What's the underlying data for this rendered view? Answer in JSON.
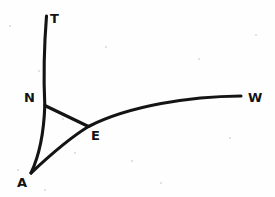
{
  "page": {
    "background_color": "#fefefe",
    "ink_color": "#141414",
    "width": 275,
    "height": 197
  },
  "diagram": {
    "title": "",
    "type": "hand-drawn-geometric-figure",
    "stroke_color": "#141414",
    "stroke_width": 3.1,
    "labels": [
      {
        "id": "T",
        "text": "T",
        "x": 50,
        "y": 12
      },
      {
        "id": "N",
        "text": "N",
        "x": 24,
        "y": 91
      },
      {
        "id": "E",
        "text": "E",
        "x": 91,
        "y": 129
      },
      {
        "id": "W",
        "text": "W",
        "x": 248,
        "y": 91
      },
      {
        "id": "A",
        "text": "A",
        "x": 17,
        "y": 176
      }
    ],
    "vertices": [
      {
        "id": "T",
        "x": 46,
        "y": 16
      },
      {
        "id": "N",
        "x": 45,
        "y": 105
      },
      {
        "id": "E",
        "x": 88,
        "y": 126
      },
      {
        "id": "W",
        "x": 241,
        "y": 96
      },
      {
        "id": "A",
        "x": 31,
        "y": 173
      }
    ],
    "paths": [
      {
        "id": "curve-T-N-A",
        "name": "vertical-curve-T-to-A",
        "kind": "curve",
        "from": "T",
        "through": "N",
        "to": "A",
        "d": "M 46.5 16 C 44.2 45 43.6 80 44.8 105.5 C 44.0 130 39.5 155 31 173"
      },
      {
        "id": "curve-A-E-W",
        "name": "arc-curve-A-to-W",
        "kind": "curve",
        "from": "A",
        "through": "E",
        "to": "W",
        "d": "M 31 173 C 48 157 68 139 88.5 126.5 C 130 105.5 190 96.5 241 96"
      },
      {
        "id": "line-N-E",
        "name": "chord-line-N-to-E",
        "kind": "line",
        "from": "N",
        "to": "E",
        "d": "M 44.8 105.5 L 88.5 126.5"
      }
    ],
    "specks": [
      {
        "x": 9,
        "y": 25,
        "size": 2
      },
      {
        "x": 38,
        "y": 70,
        "size": 2
      },
      {
        "x": 62,
        "y": 118,
        "size": 2
      },
      {
        "x": 74,
        "y": 152,
        "size": 2
      },
      {
        "x": 131,
        "y": 160,
        "size": 2
      },
      {
        "x": 198,
        "y": 58,
        "size": 2
      },
      {
        "x": 229,
        "y": 137,
        "size": 2
      },
      {
        "x": 17,
        "y": 169,
        "size": 2
      },
      {
        "x": 255,
        "y": 34,
        "size": 2
      },
      {
        "x": 105,
        "y": 46,
        "size": 2
      },
      {
        "x": 160,
        "y": 182,
        "size": 2
      },
      {
        "x": 44,
        "y": 189,
        "size": 2
      }
    ]
  }
}
